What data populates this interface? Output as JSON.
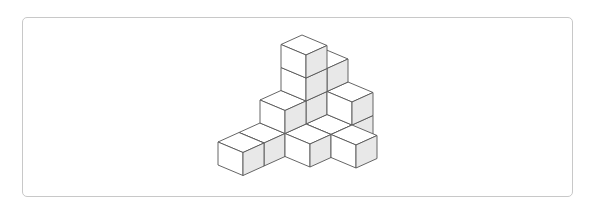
{
  "figure": {
    "type": "isometric-cube-stack",
    "colors": {
      "top": "#ffffff",
      "left_face": "#ffffff",
      "right_face": "#e8e8e8",
      "edge": "#555555",
      "frame_border": "#c8c8c8"
    },
    "projection": {
      "origin": [
        218,
        165
      ],
      "a": [
        25,
        10.5
      ],
      "b": [
        21,
        -9.5
      ],
      "h": [
        0,
        -23
      ]
    },
    "cubes": [
      [
        0,
        4,
        0
      ],
      [
        0,
        3,
        0
      ],
      [
        1,
        4,
        0
      ],
      [
        0,
        2,
        0
      ],
      [
        1,
        3,
        0
      ],
      [
        0,
        1,
        0
      ],
      [
        1,
        2,
        0
      ],
      [
        2,
        3,
        0
      ],
      [
        0,
        0,
        0
      ],
      [
        0,
        4,
        1
      ],
      [
        0,
        3,
        1
      ],
      [
        1,
        4,
        1
      ],
      [
        0,
        2,
        1
      ],
      [
        0,
        4,
        2
      ],
      [
        0,
        3,
        2
      ],
      [
        0,
        3,
        3
      ]
    ]
  }
}
